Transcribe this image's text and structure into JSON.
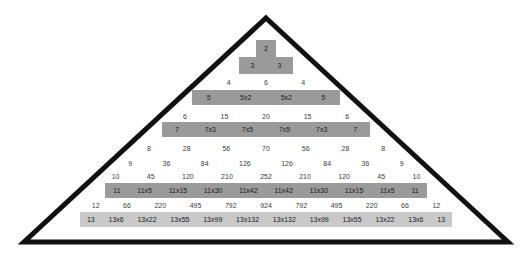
{
  "figure": {
    "triangle_outline_color": "#111111",
    "bar_color_dark": "#9a9a9a",
    "bar_color_light": "#c9c9c9",
    "text_color": "#3a3a3a"
  },
  "chart_data": {
    "type": "table",
    "xlabel": "",
    "ylabel": "",
    "grid": false,
    "legend": "none",
    "rows": [
      {
        "n": 2,
        "highlighted": true,
        "shade": "dark",
        "cells": [
          "2"
        ]
      },
      {
        "n": 3,
        "highlighted": true,
        "shade": "dark",
        "cells": [
          "3",
          "3"
        ]
      },
      {
        "n": 4,
        "highlighted": false,
        "cells": [
          "4",
          "6",
          "4"
        ]
      },
      {
        "n": 5,
        "highlighted": true,
        "shade": "dark",
        "cells": [
          "5",
          "5x2",
          "5x2",
          "5"
        ]
      },
      {
        "n": 6,
        "highlighted": false,
        "cells": [
          "6",
          "15",
          "20",
          "15",
          "6"
        ]
      },
      {
        "n": 7,
        "highlighted": true,
        "shade": "dark",
        "cells": [
          "7",
          "7x3",
          "7x5",
          "7x5",
          "7x3",
          "7"
        ]
      },
      {
        "n": 8,
        "highlighted": false,
        "cells": [
          "8",
          "28",
          "56",
          "70",
          "56",
          "28",
          "8"
        ]
      },
      {
        "n": 9,
        "highlighted": false,
        "cells": [
          "9",
          "36",
          "84",
          "126",
          "126",
          "84",
          "36",
          "9"
        ]
      },
      {
        "n": 10,
        "highlighted": false,
        "cells": [
          "10",
          "45",
          "120",
          "210",
          "252",
          "210",
          "120",
          "45",
          "10"
        ]
      },
      {
        "n": 11,
        "highlighted": true,
        "shade": "dark",
        "cells": [
          "11",
          "11x5",
          "11x15",
          "11x30",
          "11x42",
          "11x42",
          "11x30",
          "11x15",
          "11x5",
          "11"
        ]
      },
      {
        "n": 12,
        "highlighted": false,
        "cells": [
          "12",
          "66",
          "220",
          "495",
          "792",
          "924",
          "792",
          "495",
          "220",
          "66",
          "12"
        ]
      },
      {
        "n": 13,
        "highlighted": true,
        "shade": "light",
        "cells": [
          "13",
          "13x6",
          "13x22",
          "13x55",
          "13x99",
          "13x132",
          "13x132",
          "13x99",
          "13x55",
          "13x22",
          "13x6",
          "13"
        ]
      }
    ]
  }
}
